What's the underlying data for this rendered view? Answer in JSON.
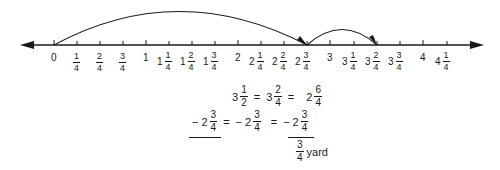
{
  "number_line": {
    "axis_color": "#1a1a1a",
    "direction": "both-arrows",
    "ticks": [
      {
        "whole": "",
        "num": "",
        "den": "",
        "int_label": "0",
        "x": 54
      },
      {
        "whole": "",
        "num": "1",
        "den": "4",
        "int_label": "",
        "x": 77
      },
      {
        "whole": "",
        "num": "2",
        "den": "4",
        "int_label": "",
        "x": 100
      },
      {
        "whole": "",
        "num": "3",
        "den": "4",
        "int_label": "",
        "x": 123
      },
      {
        "whole": "",
        "num": "",
        "den": "",
        "int_label": "1",
        "x": 146
      },
      {
        "whole": "1",
        "num": "1",
        "den": "4",
        "int_label": "",
        "x": 169
      },
      {
        "whole": "1",
        "num": "2",
        "den": "4",
        "int_label": "",
        "x": 192
      },
      {
        "whole": "1",
        "num": "3",
        "den": "4",
        "int_label": "",
        "x": 215
      },
      {
        "whole": "",
        "num": "",
        "den": "",
        "int_label": "2",
        "x": 238
      },
      {
        "whole": "2",
        "num": "1",
        "den": "4",
        "int_label": "",
        "x": 261
      },
      {
        "whole": "2",
        "num": "2",
        "den": "4",
        "int_label": "",
        "x": 284
      },
      {
        "whole": "2",
        "num": "3",
        "den": "4",
        "int_label": "",
        "x": 307
      },
      {
        "whole": "",
        "num": "",
        "den": "",
        "int_label": "3",
        "x": 330
      },
      {
        "whole": "3",
        "num": "1",
        "den": "4",
        "int_label": "",
        "x": 354
      },
      {
        "whole": "3",
        "num": "2",
        "den": "4",
        "int_label": "",
        "x": 377
      },
      {
        "whole": "3",
        "num": "3",
        "den": "4",
        "int_label": "",
        "x": 400
      },
      {
        "whole": "",
        "num": "",
        "den": "",
        "int_label": "4",
        "x": 423
      },
      {
        "whole": "4",
        "num": "1",
        "den": "4",
        "int_label": "",
        "x": 447
      }
    ],
    "arcs": [
      {
        "from": "0",
        "to": "2 3/4",
        "description": "large jump"
      },
      {
        "from": "2 3/4",
        "to": "3 2/4",
        "description": "small jump"
      }
    ]
  },
  "equations": {
    "row1": {
      "a_whole": "3",
      "a_num": "1",
      "a_den": "2",
      "eq1": "=",
      "b_whole": "3",
      "b_num": "2",
      "b_den": "4",
      "eq2": "=",
      "c_whole": "2",
      "c_num": "6",
      "c_den": "4"
    },
    "row2": {
      "minus1": "−",
      "a_whole": "2",
      "a_num": "3",
      "a_den": "4",
      "eq1": "=",
      "minus2": "−",
      "b_whole": "2",
      "b_num": "3",
      "b_den": "4",
      "eq2": "=",
      "minus3": "−",
      "c_whole": "2",
      "c_num": "3",
      "c_den": "4"
    },
    "result": {
      "num": "3",
      "den": "4",
      "unit": "yard"
    }
  }
}
